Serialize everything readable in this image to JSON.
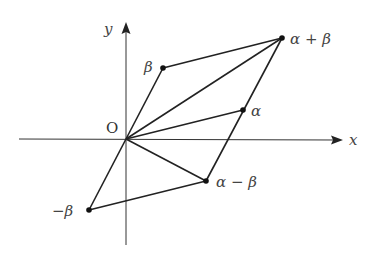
{
  "diagram": {
    "title": "",
    "axes": {
      "x_label": "x",
      "y_label": "y",
      "origin_label": "O"
    },
    "points": [
      {
        "id": "alpha",
        "label": "α",
        "px": [
          243,
          110
        ]
      },
      {
        "id": "beta",
        "label": "β",
        "px": [
          163,
          68
        ]
      },
      {
        "id": "alpha_plus_beta",
        "label": "α + β",
        "px": [
          282,
          38
        ]
      },
      {
        "id": "alpha_minus_beta",
        "label": "α − β",
        "px": [
          206,
          181
        ]
      },
      {
        "id": "neg_beta",
        "label": "−β",
        "px": [
          89,
          210
        ]
      }
    ],
    "segments": [
      [
        "O",
        "beta"
      ],
      [
        "beta",
        "alpha_plus_beta"
      ],
      [
        "O",
        "alpha_plus_beta"
      ],
      [
        "O",
        "alpha"
      ],
      [
        "alpha",
        "alpha_plus_beta"
      ],
      [
        "alpha",
        "alpha_minus_beta"
      ],
      [
        "O",
        "alpha_minus_beta"
      ],
      [
        "O",
        "neg_beta"
      ],
      [
        "neg_beta",
        "alpha_minus_beta"
      ]
    ],
    "colors": {
      "line": "#222222",
      "axis": "#333333",
      "label": "#444444"
    }
  }
}
